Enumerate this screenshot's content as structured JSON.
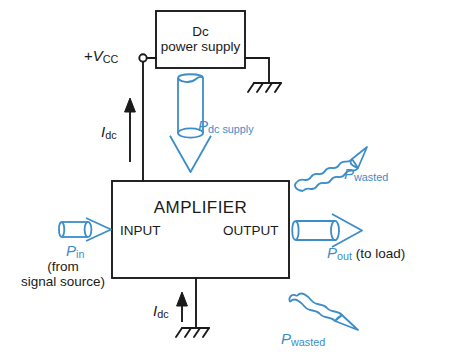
{
  "diagram": {
    "colors": {
      "line_black": "#1a1a1a",
      "accent_blue": "#3c8dc8",
      "background": "#ffffff"
    },
    "blocks": {
      "power_supply": {
        "line1": "Dc",
        "line2": "power supply"
      },
      "amplifier": {
        "title": "AMPLIFIER",
        "input_label": "INPUT",
        "output_label": "OUTPUT"
      }
    },
    "labels": {
      "vcc_sign": "+",
      "vcc_symbol": "V",
      "vcc_sub": "CC",
      "idc_symbol": "I",
      "idc_sub": "dc",
      "idc_top_symbol": "I",
      "idc_top_sub": "dc",
      "idc_bottom_symbol": "I",
      "idc_bottom_sub": "dc",
      "p_dc_symbol": "P",
      "p_dc_sub": "dc supply",
      "p_in_symbol": "P",
      "p_in_sub": "in",
      "p_in_note_line1": "(from",
      "p_in_note_line2": "signal source)",
      "p_out_symbol": "P",
      "p_out_sub": "out",
      "p_out_note": "(to load)",
      "p_wasted_top_symbol": "P",
      "p_wasted_top_sub": "wasted",
      "p_wasted_bottom_symbol": "P",
      "p_wasted_bottom_sub": "wasted"
    }
  }
}
